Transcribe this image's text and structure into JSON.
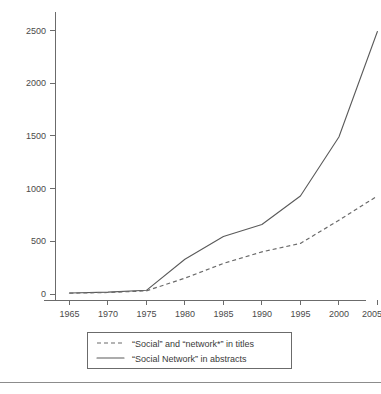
{
  "chart_data": {
    "type": "line",
    "title": "",
    "xlabel": "",
    "ylabel": "",
    "xlim": [
      1963,
      2007
    ],
    "ylim": [
      0,
      2650
    ],
    "xticks": [
      1965,
      1970,
      1975,
      1980,
      1985,
      1990,
      1995,
      2000,
      2005
    ],
    "yticks": [
      0,
      500,
      1000,
      1500,
      2000,
      2500
    ],
    "grid": false,
    "legend_position": "below-center",
    "x": [
      1965,
      1970,
      1975,
      1980,
      1985,
      1990,
      1995,
      2000,
      2005
    ],
    "series": [
      {
        "name": "“Social” and “network*” in titles",
        "style": "dashed",
        "color": "#6a6a6a",
        "values": [
          8,
          14,
          30,
          150,
          290,
          400,
          480,
          700,
          930
        ]
      },
      {
        "name": "“Social Network” in abstracts",
        "style": "solid",
        "color": "#5a5a5a",
        "values": [
          10,
          18,
          35,
          330,
          545,
          660,
          930,
          1490,
          2490
        ]
      }
    ]
  },
  "axes": {
    "y_tick_labels": [
      "2500",
      "2000",
      "1500",
      "1000",
      "500",
      "0"
    ],
    "x_tick_labels": [
      "1965",
      "1970",
      "1975",
      "1980",
      "1985",
      "1990",
      "1995",
      "2000",
      "2005"
    ]
  },
  "legend": {
    "entries": [
      {
        "label": "“Social” and “network*” in titles",
        "marker": "dashed-line-marker"
      },
      {
        "label": "“Social Network” in abstracts",
        "marker": "solid-line-marker"
      }
    ]
  }
}
